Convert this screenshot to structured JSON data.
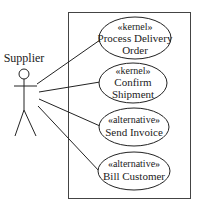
{
  "actor": {
    "name": "Supplier"
  },
  "system_boundary": {
    "stroke": "#444444"
  },
  "use_cases": [
    {
      "stereotype": "«kernel»",
      "lines": [
        "Process Delivery",
        "Order"
      ]
    },
    {
      "stereotype": "«kernel»",
      "lines": [
        "Confirm",
        "Shipment"
      ]
    },
    {
      "stereotype": "«alternative»",
      "lines": [
        "Send Invoice"
      ]
    },
    {
      "stereotype": "«alternative»",
      "lines": [
        "Bill Customer"
      ]
    }
  ]
}
